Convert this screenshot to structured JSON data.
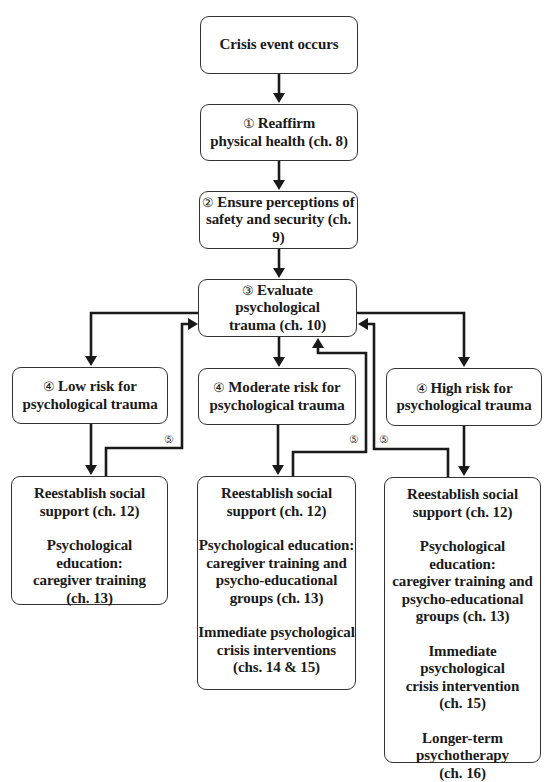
{
  "diagram": {
    "nodes": {
      "start": {
        "label": "Crisis event occurs"
      },
      "step1": {
        "num": "①",
        "line1": "Reaffirm",
        "line2": "physical health (ch. 8)"
      },
      "step2": {
        "num": "②",
        "line1": "Ensure perceptions of",
        "line2": "safety and security (ch. 9)"
      },
      "step3": {
        "num": "③",
        "line1": "Evaluate psychological",
        "line2": "trauma (ch. 10)"
      },
      "low": {
        "num": "④",
        "line1": "Low risk for",
        "line2": "psychological trauma"
      },
      "moderate": {
        "num": "④",
        "line1": "Moderate risk for",
        "line2": "psychological trauma"
      },
      "high": {
        "num": "④",
        "line1": "High risk for",
        "line2": "psychological trauma"
      }
    },
    "actions": {
      "low": [
        {
          "lines": [
            "Reestablish social",
            "support (ch. 12)"
          ]
        },
        {
          "lines": [
            "Psychological education:",
            "caregiver training",
            "(ch. 13)"
          ]
        }
      ],
      "moderate": [
        {
          "lines": [
            "Reestablish social",
            "support (ch. 12)"
          ]
        },
        {
          "lines": [
            "Psychological education:",
            "caregiver training and",
            "psycho-educational",
            "groups (ch. 13)"
          ]
        },
        {
          "lines": [
            "Immediate psychological",
            "crisis interventions",
            "(chs. 14 & 15)"
          ]
        }
      ],
      "high": [
        {
          "lines": [
            "Reestablish social",
            "support (ch. 12)"
          ]
        },
        {
          "lines": [
            "Psychological education:",
            "caregiver training and",
            "psycho-educational",
            "groups (ch. 13)"
          ]
        },
        {
          "lines": [
            "Immediate psychological",
            "crisis intervention",
            "(ch. 15)"
          ]
        },
        {
          "lines": [
            "Longer-term",
            "psychotherapy",
            "(ch. 16)"
          ]
        }
      ]
    },
    "feedback_label": "⑤",
    "edges": [
      {
        "from": "start",
        "to": "step1"
      },
      {
        "from": "step1",
        "to": "step2"
      },
      {
        "from": "step2",
        "to": "step3"
      },
      {
        "from": "step3",
        "to": "low"
      },
      {
        "from": "step3",
        "to": "moderate"
      },
      {
        "from": "step3",
        "to": "high"
      },
      {
        "from": "low",
        "to": "actions.low"
      },
      {
        "from": "moderate",
        "to": "actions.moderate"
      },
      {
        "from": "high",
        "to": "actions.high"
      },
      {
        "from": "actions.low",
        "to": "step3",
        "label": "⑤"
      },
      {
        "from": "actions.moderate",
        "to": "step3",
        "label": "⑤"
      },
      {
        "from": "actions.high",
        "to": "step3",
        "label": "⑤"
      }
    ],
    "colors": {
      "line": "#1a1a1a",
      "border": "#333333",
      "background": "#ffffff"
    }
  }
}
